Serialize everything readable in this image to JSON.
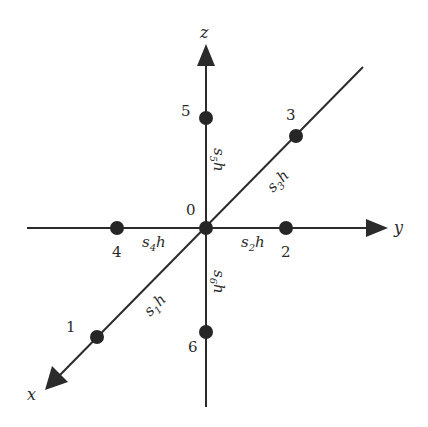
{
  "diagram": {
    "type": "3d-stencil-axes",
    "colors": {
      "line": "#2b2b2b",
      "point": "#262626",
      "text": "#2b2b2b",
      "background": "#ffffff"
    },
    "axes": {
      "x": {
        "label": "x"
      },
      "y": {
        "label": "y"
      },
      "z": {
        "label": "z"
      }
    },
    "points": [
      {
        "id": "0",
        "label": "0"
      },
      {
        "id": "1",
        "label": "1"
      },
      {
        "id": "2",
        "label": "2"
      },
      {
        "id": "3",
        "label": "3"
      },
      {
        "id": "4",
        "label": "4"
      },
      {
        "id": "5",
        "label": "5"
      },
      {
        "id": "6",
        "label": "6"
      }
    ],
    "spacings": [
      {
        "id": "s1h",
        "base": "s",
        "sub": "1",
        "tail": "h"
      },
      {
        "id": "s2h",
        "base": "s",
        "sub": "2",
        "tail": "h"
      },
      {
        "id": "s3h",
        "base": "s",
        "sub": "3",
        "tail": "h"
      },
      {
        "id": "s4h",
        "base": "s",
        "sub": "4",
        "tail": "h"
      },
      {
        "id": "s5h",
        "base": "s",
        "sub": "5",
        "tail": "h"
      },
      {
        "id": "s6h",
        "base": "s",
        "sub": "6",
        "tail": "h"
      }
    ]
  }
}
